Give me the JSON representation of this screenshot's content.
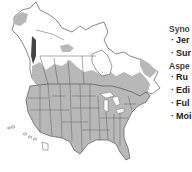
{
  "map": {
    "title": "North America range map",
    "colors": {
      "range_fill": "#b8b8b8",
      "outside_fill": "#ffffff",
      "borders": "#555555",
      "dense_range": "#444444"
    }
  },
  "legend": {
    "sections": [
      {
        "heading": "Syno",
        "items": [
          "Jer",
          "Sur"
        ]
      },
      {
        "heading": "Aspe",
        "items": [
          "Ru",
          "Edi",
          "Ful",
          "Moi"
        ]
      }
    ]
  }
}
